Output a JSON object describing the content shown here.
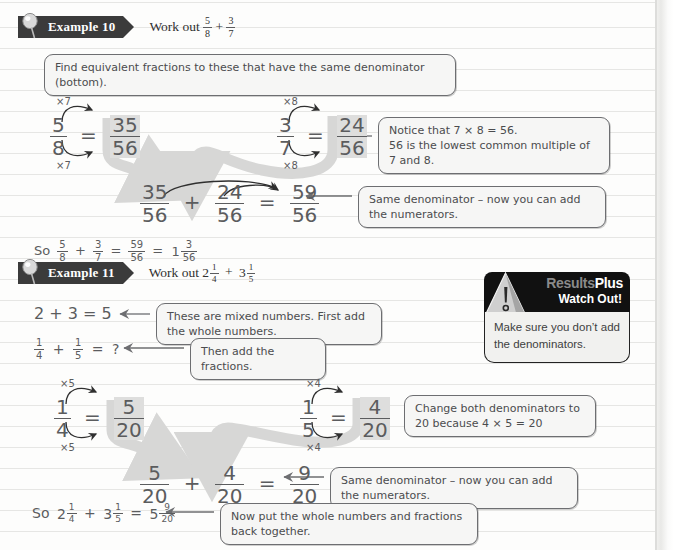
{
  "page": {
    "background_color": "#fdfdfc",
    "rule_color": "#e6e6e4",
    "ink_color": "#5b5c5e"
  },
  "example10": {
    "tag_label": "Example 10",
    "task": "Work out",
    "task_fraction_1": {
      "num": "5",
      "den": "8"
    },
    "task_operator": "+",
    "task_fraction_2": {
      "num": "3",
      "den": "7"
    },
    "instruction": "Find equivalent fractions to these that have the same denominator (bottom).",
    "conversion_left": {
      "top_multiplier": "×7",
      "bottom_multiplier": "×7",
      "from": {
        "num": "5",
        "den": "8"
      },
      "equals": "=",
      "to": {
        "num": "35",
        "den": "56"
      }
    },
    "conversion_right": {
      "top_multiplier": "×8",
      "bottom_multiplier": "×8",
      "from": {
        "num": "3",
        "den": "7"
      },
      "equals": "=",
      "to": {
        "num": "24",
        "den": "56"
      }
    },
    "note_lcm_line1": "Notice that 7 × 8 = 56.",
    "note_lcm_line2": "56 is the lowest common multiple of 7 and 8.",
    "sum_line": {
      "a": {
        "num": "35",
        "den": "56"
      },
      "op": "+",
      "b": {
        "num": "24",
        "den": "56"
      },
      "eq": "=",
      "result": {
        "num": "59",
        "den": "56"
      }
    },
    "note_same_denominator": "Same denominator – now you can add the numerators.",
    "conclusion": {
      "prefix": "So",
      "a": {
        "num": "5",
        "den": "8"
      },
      "op": "+",
      "b": {
        "num": "3",
        "den": "7"
      },
      "eq1": "=",
      "improper": {
        "num": "59",
        "den": "56"
      },
      "eq2": "=",
      "mixed_whole": "1",
      "mixed_fraction": {
        "num": "3",
        "den": "56"
      }
    }
  },
  "example11": {
    "tag_label": "Example 11",
    "task": "Work out",
    "task_mixed_1": {
      "whole": "2",
      "num": "1",
      "den": "4"
    },
    "task_operator": "+",
    "task_mixed_2": {
      "whole": "3",
      "num": "1",
      "den": "5"
    },
    "whole_numbers_line": "2 + 3 = 5",
    "note_mixed_numbers": "These are mixed numbers. First add the whole numbers.",
    "fractions_question": {
      "a": {
        "num": "1",
        "den": "4"
      },
      "op": "+",
      "b": {
        "num": "1",
        "den": "5"
      },
      "eq": "=",
      "result": "?"
    },
    "note_then_add": "Then add the fractions.",
    "conversion_left": {
      "top_multiplier": "×5",
      "bottom_multiplier": "×5",
      "from": {
        "num": "1",
        "den": "4"
      },
      "equals": "=",
      "to": {
        "num": "5",
        "den": "20"
      }
    },
    "conversion_right": {
      "top_multiplier": "×4",
      "bottom_multiplier": "×4",
      "from": {
        "num": "1",
        "den": "5"
      },
      "equals": "=",
      "to": {
        "num": "4",
        "den": "20"
      }
    },
    "note_change_line1": "Change both denominators to",
    "note_change_line2": "20 because 4 × 5 = 20",
    "sum_line": {
      "a": {
        "num": "5",
        "den": "20"
      },
      "op": "+",
      "b": {
        "num": "4",
        "den": "20"
      },
      "eq": "=",
      "result": {
        "num": "9",
        "den": "20"
      }
    },
    "note_same_denominator": "Same denominator – now you can add the numerators.",
    "conclusion": {
      "prefix": "So",
      "a": {
        "whole": "2",
        "num": "1",
        "den": "4"
      },
      "op": "+",
      "b": {
        "whole": "3",
        "num": "1",
        "den": "5"
      },
      "eq": "=",
      "result": {
        "whole": "5",
        "num": "9",
        "den": "20"
      }
    },
    "note_put_back": "Now put the whole numbers and fractions back together."
  },
  "results_plus": {
    "brand_part1": "Results",
    "brand_part2": "Plus",
    "subtitle": "Watch Out!",
    "body_line1": "Make sure you don’t add",
    "body_line2": "the denominators.",
    "header_color": "#111111",
    "body_color": "#f1f1ef",
    "brand_part1_color": "#8a8a8a",
    "brand_part2_color": "#ffffff"
  },
  "icons": {
    "example_pin": "pin-icon",
    "warning_triangle": "warning-triangle-icon",
    "flow_arrow": "flow-arrow-icon",
    "pointer_arrow": "pointer-arrow-icon"
  }
}
